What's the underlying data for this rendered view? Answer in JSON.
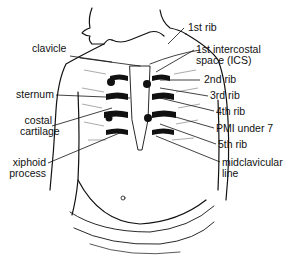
{
  "figure": {
    "labels_left": [
      {
        "id": "clavicle",
        "lines": [
          "clavicle"
        ]
      },
      {
        "id": "sternum",
        "lines": [
          "sternum"
        ]
      },
      {
        "id": "costal-cartilage",
        "lines": [
          "costal",
          "cartilage"
        ]
      },
      {
        "id": "xiphoid-process",
        "lines": [
          "xiphoid",
          "process"
        ]
      }
    ],
    "labels_right": [
      {
        "id": "1st-rib",
        "lines": [
          "1st rib"
        ]
      },
      {
        "id": "1st-ics",
        "lines": [
          "1st intercostal",
          "space (ICS)"
        ]
      },
      {
        "id": "2nd-rib",
        "lines": [
          "2nd rib"
        ]
      },
      {
        "id": "3rd-rib",
        "lines": [
          "3rd rib"
        ]
      },
      {
        "id": "4th-rib",
        "lines": [
          "4th rib"
        ]
      },
      {
        "id": "pmi",
        "lines": [
          "PMI under 7"
        ]
      },
      {
        "id": "5th-rib",
        "lines": [
          "5th rib"
        ]
      },
      {
        "id": "midclavicular-line",
        "lines": [
          "midclavicular",
          "line"
        ]
      }
    ],
    "colors": {
      "ink": "#111111",
      "background": "#ffffff"
    }
  }
}
